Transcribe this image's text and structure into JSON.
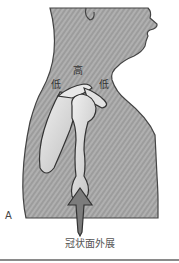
{
  "figure": {
    "panel_label": "A",
    "caption": "冠状面外展",
    "labels": {
      "high": "高",
      "low_left": "低",
      "low_right": "低"
    },
    "colors": {
      "body": "#9a9a9a",
      "body_stripe": "#b2b2b2",
      "bone": "#d9d9d9",
      "outline": "#3a3a3a",
      "arrow": "#7a7a7a"
    }
  }
}
